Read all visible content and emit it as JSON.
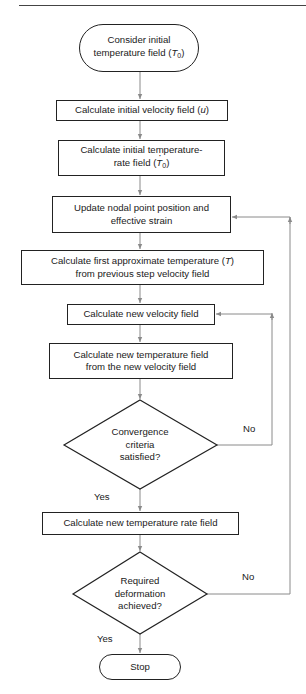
{
  "diagram": {
    "type": "flowchart",
    "colors": {
      "stroke": "#222222",
      "connector": "#8a8a8a",
      "background": "#ffffff",
      "text": "#1a1a1a"
    },
    "nodes": [
      {
        "id": "start",
        "shape": "terminator",
        "lines": [
          "Consider initial",
          "temperature field ("
        ],
        "symbol": "T",
        "subscript": "0",
        "suffix": ")"
      },
      {
        "id": "init_velocity",
        "shape": "process",
        "text_prefix": "Calculate initial velocity field (",
        "symbol": "u",
        "suffix": ")"
      },
      {
        "id": "init_temp_rate",
        "shape": "process",
        "line1": "Calculate initial temperature-",
        "line2_prefix": "rate field (",
        "symbol": "T",
        "subscript": "0",
        "dot": true,
        "suffix": ")"
      },
      {
        "id": "update_nodal",
        "shape": "process",
        "line1": "Update nodal point position and",
        "line2": "effective strain"
      },
      {
        "id": "first_approx_temp",
        "shape": "process",
        "line1_prefix": "Calculate first approximate temperature (",
        "symbol": "T",
        "suffix": ")",
        "line2": "from previous step velocity field"
      },
      {
        "id": "new_velocity",
        "shape": "process",
        "text": "Calculate new velocity field"
      },
      {
        "id": "new_temp_field",
        "shape": "process",
        "line1": "Calculate new temperature field",
        "line2": "from the new velocity field"
      },
      {
        "id": "convergence",
        "shape": "decision",
        "line1": "Convergence",
        "line2": "criteria",
        "line3": "satisfied?"
      },
      {
        "id": "new_temp_rate",
        "shape": "process",
        "text": "Calculate new temperature rate field"
      },
      {
        "id": "deformation",
        "shape": "decision",
        "line1": "Required",
        "line2": "deformation",
        "line3": "achieved?"
      },
      {
        "id": "stop",
        "shape": "terminator",
        "text": "Stop"
      }
    ],
    "edge_labels": {
      "convergence_no": "No",
      "convergence_yes": "Yes",
      "deformation_no": "No",
      "deformation_yes": "Yes"
    },
    "edges": [
      {
        "from": "start",
        "to": "init_velocity"
      },
      {
        "from": "init_velocity",
        "to": "init_temp_rate"
      },
      {
        "from": "init_temp_rate",
        "to": "update_nodal"
      },
      {
        "from": "update_nodal",
        "to": "first_approx_temp"
      },
      {
        "from": "first_approx_temp",
        "to": "new_velocity"
      },
      {
        "from": "new_velocity",
        "to": "new_temp_field"
      },
      {
        "from": "new_temp_field",
        "to": "convergence"
      },
      {
        "from": "convergence",
        "to": "new_temp_rate",
        "label": "Yes"
      },
      {
        "from": "convergence",
        "to": "new_velocity",
        "label": "No"
      },
      {
        "from": "new_temp_rate",
        "to": "deformation"
      },
      {
        "from": "deformation",
        "to": "stop",
        "label": "Yes"
      },
      {
        "from": "deformation",
        "to": "update_nodal",
        "label": "No"
      }
    ]
  }
}
